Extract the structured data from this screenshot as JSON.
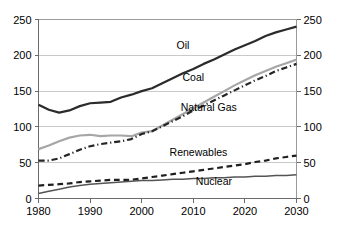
{
  "chart_data": {
    "type": "line",
    "title": "",
    "xlabel": "",
    "ylabel": "",
    "xlim": [
      1980,
      2030
    ],
    "ylim": [
      0,
      250
    ],
    "grid": true,
    "legend": "inline-labels",
    "x_ticks": [
      "1980",
      "1990",
      "2000",
      "2010",
      "2020",
      "2030"
    ],
    "x_tick_values": [
      1980,
      1990,
      2000,
      2010,
      2020,
      2030
    ],
    "y_ticks_left": [
      "0",
      "50",
      "100",
      "150",
      "200",
      "250"
    ],
    "y_ticks_right": [
      "0",
      "50",
      "100",
      "150",
      "200",
      "250"
    ],
    "y_tick_values": [
      0,
      50,
      100,
      150,
      200,
      250
    ],
    "x": [
      1980,
      1982,
      1984,
      1986,
      1988,
      1990,
      1992,
      1994,
      1996,
      1998,
      2000,
      2002,
      2004,
      2006,
      2008,
      2010,
      2012,
      2014,
      2016,
      2018,
      2020,
      2022,
      2024,
      2026,
      2028,
      2030
    ],
    "series": [
      {
        "name": "Oil",
        "color": "#2b2b2b",
        "style": "solid",
        "width": 2.2,
        "label": "Oil",
        "label_x": 2008,
        "label_y": 215,
        "values": [
          131,
          124,
          120,
          123,
          129,
          133,
          134,
          135,
          141,
          145,
          150,
          154,
          161,
          168,
          175,
          181,
          188,
          194,
          201,
          208,
          214,
          220,
          227,
          232,
          236,
          240
        ]
      },
      {
        "name": "Coal",
        "color": "#a6a6a6",
        "style": "solid",
        "width": 2.2,
        "label": "Coal",
        "label_x": 2010,
        "label_y": 170,
        "values": [
          69,
          74,
          80,
          85,
          88,
          89,
          87,
          88,
          88,
          87,
          92,
          94,
          102,
          110,
          118,
          126,
          134,
          142,
          150,
          158,
          165,
          172,
          178,
          184,
          189,
          194
        ]
      },
      {
        "name": "Natural Gas",
        "color": "#262626",
        "style": "dashdot",
        "width": 2.2,
        "label": "Natural Gas",
        "label_x": 2013,
        "label_y": 128,
        "values": [
          53,
          53,
          56,
          62,
          68,
          73,
          76,
          78,
          80,
          83,
          90,
          94,
          101,
          108,
          115,
          123,
          130,
          137,
          144,
          151,
          158,
          165,
          171,
          178,
          183,
          188
        ]
      },
      {
        "name": "Renewables",
        "color": "#1f1f1f",
        "style": "dashed",
        "width": 2.2,
        "label": "Renewables",
        "label_x": 2011,
        "label_y": 65,
        "values": [
          18,
          19,
          20,
          21,
          23,
          24,
          25,
          26,
          26,
          26,
          28,
          30,
          32,
          34,
          36,
          38,
          40,
          42,
          44,
          46,
          48,
          51,
          53,
          56,
          58,
          60
        ]
      },
      {
        "name": "Nuclear",
        "color": "#545454",
        "style": "solid",
        "width": 1.5,
        "label": "Nuclear",
        "label_x": 2014,
        "label_y": 25,
        "values": [
          7,
          10,
          13,
          16,
          18,
          20,
          21,
          22,
          23,
          24,
          25,
          25,
          26,
          27,
          27,
          28,
          28,
          29,
          29,
          30,
          30,
          31,
          31,
          32,
          32,
          33
        ]
      }
    ]
  }
}
